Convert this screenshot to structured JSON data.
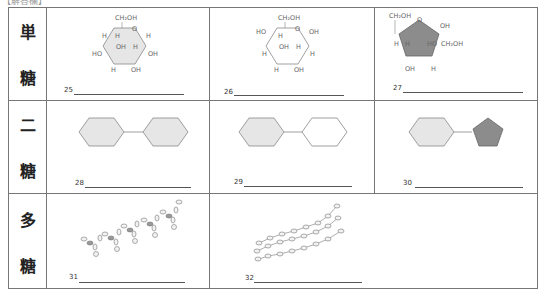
{
  "header": {
    "text": "【解答欄】"
  },
  "rows": [
    {
      "label_chars": [
        "単",
        "糖"
      ]
    },
    {
      "label_chars": [
        "二",
        "糖"
      ]
    },
    {
      "label_chars": [
        "多",
        "糖"
      ]
    }
  ],
  "cells": {
    "q25": {
      "number": "25",
      "structure": "glucose-alpha-ring",
      "labels": [
        "CH2OH",
        "O",
        "H",
        "H",
        "OH",
        "H",
        "HO",
        "OH",
        "H",
        "OH",
        "H",
        "OH"
      ]
    },
    "q26": {
      "number": "26",
      "structure": "glucose-beta-ring",
      "labels": [
        "CH2OH",
        "O",
        "HO",
        "OH",
        "H",
        "OH",
        "H",
        "H",
        "H",
        "OH",
        "H",
        "OH"
      ]
    },
    "q27": {
      "number": "27",
      "structure": "fructose-ring",
      "labels": [
        "CH2OH",
        "O",
        "OH",
        "H",
        "H",
        "HO",
        "CH2OH",
        "OH",
        "H"
      ]
    },
    "q28": {
      "number": "28",
      "structure": "disaccharide-gray-gray"
    },
    "q29": {
      "number": "29",
      "structure": "disaccharide-gray-white"
    },
    "q30": {
      "number": "30",
      "structure": "disaccharide-gray-darkpentagon"
    },
    "q31": {
      "number": "31",
      "structure": "polysaccharide-helix"
    },
    "q32": {
      "number": "32",
      "structure": "polysaccharide-parallel-chains"
    }
  },
  "colors": {
    "light_fill": "#e6e6e6",
    "dark_fill": "#8c8c8c",
    "white_fill": "#ffffff",
    "stroke": "#888888",
    "grid": "#777777"
  }
}
